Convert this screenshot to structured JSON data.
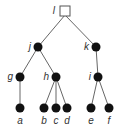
{
  "diagram": {
    "type": "tree",
    "root": {
      "id": "l",
      "label": "l",
      "shape": "square",
      "x": 65,
      "y": 15
    },
    "nodes": [
      {
        "id": "j",
        "label": "j",
        "x": 38,
        "y": 47,
        "label_side": "left"
      },
      {
        "id": "k",
        "label": "k",
        "x": 96,
        "y": 47,
        "label_side": "left"
      },
      {
        "id": "g",
        "label": "g",
        "x": 20,
        "y": 77,
        "label_side": "left"
      },
      {
        "id": "h",
        "label": "h",
        "x": 56,
        "y": 77,
        "label_side": "left"
      },
      {
        "id": "i",
        "label": "i",
        "x": 98,
        "y": 77,
        "label_side": "left"
      },
      {
        "id": "a",
        "label": "a",
        "x": 20,
        "y": 108,
        "label_side": "below"
      },
      {
        "id": "b",
        "label": "b",
        "x": 44,
        "y": 108,
        "label_side": "below"
      },
      {
        "id": "c",
        "label": "c",
        "x": 56,
        "y": 108,
        "label_side": "below"
      },
      {
        "id": "d",
        "label": "d",
        "x": 67,
        "y": 108,
        "label_side": "below"
      },
      {
        "id": "e",
        "label": "e",
        "x": 91,
        "y": 108,
        "label_side": "below"
      },
      {
        "id": "f",
        "label": "f",
        "x": 109,
        "y": 108,
        "label_side": "below"
      }
    ],
    "edges": [
      [
        "l",
        "j"
      ],
      [
        "l",
        "k"
      ],
      [
        "j",
        "g"
      ],
      [
        "j",
        "h"
      ],
      [
        "k",
        "i"
      ],
      [
        "g",
        "a"
      ],
      [
        "h",
        "b"
      ],
      [
        "h",
        "c"
      ],
      [
        "h",
        "d"
      ],
      [
        "i",
        "e"
      ],
      [
        "i",
        "f"
      ]
    ],
    "colors": {
      "node": "#111111",
      "edge": "#666666",
      "label": "#333333",
      "root_fill": "#ffffff",
      "root_stroke": "#555555"
    }
  }
}
